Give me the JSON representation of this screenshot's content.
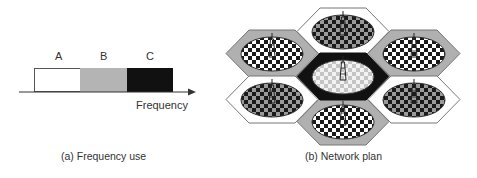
{
  "panel_a": {
    "caption": "(a) Frequency use",
    "axis_label": "Frequency",
    "bands": [
      {
        "label": "A",
        "fill": "#ffffff"
      },
      {
        "label": "B",
        "fill": "#b4b4b4"
      },
      {
        "label": "C",
        "fill": "#111111"
      }
    ]
  },
  "panel_b": {
    "caption": "(b) Network plan",
    "cells": [
      {
        "position": "top",
        "hex_fill": "#ffffff",
        "pattern": "dark-checker"
      },
      {
        "position": "top-left",
        "hex_fill": "#b0b0b0",
        "pattern": "bw-checker"
      },
      {
        "position": "top-right",
        "hex_fill": "#b0b0b0",
        "pattern": "bw-checker"
      },
      {
        "position": "center",
        "hex_fill": "#111111",
        "pattern": "light-checker"
      },
      {
        "position": "bottom-left",
        "hex_fill": "#ffffff",
        "pattern": "dark-checker"
      },
      {
        "position": "bottom-right",
        "hex_fill": "#ffffff",
        "pattern": "dark-checker"
      },
      {
        "position": "bottom",
        "hex_fill": "#b0b0b0",
        "pattern": "bw-checker"
      }
    ]
  }
}
